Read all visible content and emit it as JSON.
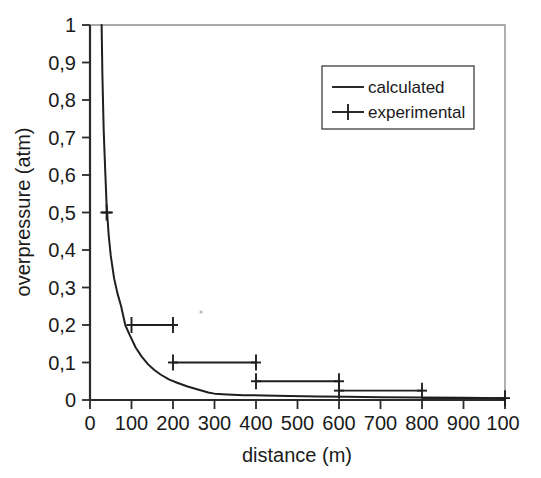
{
  "figure": {
    "background_color": "#ffffff",
    "ink_color": "#1f1f1f",
    "frame_color": "#8f8f8f"
  },
  "chart_data": {
    "type": "line",
    "title": "",
    "xlabel": "distance (m)",
    "ylabel": "overpressure (atm)",
    "xlim": [
      0,
      1000
    ],
    "ylim": [
      0,
      1
    ],
    "grid": false,
    "legend_position": "top-right",
    "x_tick_labels": [
      "0",
      "100",
      "200",
      "300",
      "400",
      "500",
      "600",
      "700",
      "800",
      "900",
      "100"
    ],
    "x_tick_values": [
      0,
      100,
      200,
      300,
      400,
      500,
      600,
      700,
      800,
      900,
      1000
    ],
    "y_tick_labels": [
      "0",
      "0,1",
      "0,2",
      "0,3",
      "0,4",
      "0,5",
      "0,6",
      "0,7",
      "0,8",
      "0,9",
      "1"
    ],
    "y_tick_values": [
      0,
      0.1,
      0.2,
      0.3,
      0.4,
      0.5,
      0.6,
      0.7,
      0.8,
      0.9,
      1.0
    ],
    "decimal_separator": ",",
    "series": [
      {
        "name": "calculated",
        "style": "line",
        "x": [
          28,
          30,
          33,
          36,
          40,
          45,
          50,
          58,
          66,
          75,
          85,
          95,
          110,
          125,
          140,
          155,
          170,
          190,
          210,
          235,
          260,
          285,
          300,
          330,
          370,
          420,
          480,
          550,
          620,
          700,
          800,
          900,
          1000
        ],
        "values": [
          1.0,
          0.86,
          0.72,
          0.63,
          0.52,
          0.44,
          0.385,
          0.325,
          0.285,
          0.25,
          0.2,
          0.175,
          0.14,
          0.115,
          0.095,
          0.08,
          0.068,
          0.055,
          0.046,
          0.036,
          0.028,
          0.02,
          0.017,
          0.015,
          0.013,
          0.012,
          0.011,
          0.0095,
          0.0085,
          0.0075,
          0.0065,
          0.006,
          0.005
        ]
      },
      {
        "name": "experimental",
        "style": "step-segments-with-plus-markers",
        "segments": [
          {
            "x_start": 25,
            "x_end": 55,
            "y": 0.5
          },
          {
            "x_start": 100,
            "x_end": 200,
            "y": 0.2
          },
          {
            "x_start": 200,
            "x_end": 400,
            "y": 0.1
          },
          {
            "x_start": 400,
            "x_end": 600,
            "y": 0.05
          },
          {
            "x_start": 600,
            "x_end": 800,
            "y": 0.025
          },
          {
            "x_start": 800,
            "x_end": 1000,
            "y": 0.005
          }
        ],
        "marker_points": [
          {
            "x": 40,
            "y": 0.5
          },
          {
            "x": 100,
            "y": 0.2
          },
          {
            "x": 200,
            "y": 0.2
          },
          {
            "x": 200,
            "y": 0.1
          },
          {
            "x": 400,
            "y": 0.1
          },
          {
            "x": 400,
            "y": 0.05
          },
          {
            "x": 600,
            "y": 0.05
          },
          {
            "x": 600,
            "y": 0.025
          },
          {
            "x": 800,
            "y": 0.025
          },
          {
            "x": 1000,
            "y": 0.005
          }
        ]
      }
    ]
  },
  "legend": {
    "entries": [
      {
        "label": "calculated",
        "marker": "line"
      },
      {
        "label": "experimental",
        "marker": "line-plus"
      }
    ]
  }
}
